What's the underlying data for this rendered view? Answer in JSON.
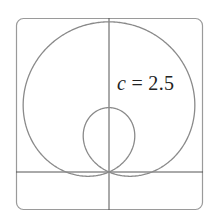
{
  "chart_data": {
    "type": "line",
    "subtype": "polar",
    "title": "",
    "equation": "r = 1 + c sin(theta)",
    "parameter": {
      "name": "c",
      "value": 2.5
    },
    "annotation": "c = 2.5",
    "xlabel": "",
    "ylabel": "",
    "xlim": [
      -2.1,
      2.2
    ],
    "ylim": [
      -0.9,
      3.6
    ],
    "grid": false,
    "legend": null,
    "axes": {
      "x_axis_at": 0,
      "y_axis_at": 0
    },
    "features": {
      "outer_loop_max_r": 3.5,
      "inner_loop_max_r": 1.5,
      "pole": [
        0,
        0
      ]
    },
    "colors": {
      "curve": "#8a8a8a",
      "axes": "#555555",
      "frame": "#9a9a9a"
    }
  },
  "annotation": {
    "var": "c",
    "rest": " = 2.5"
  }
}
